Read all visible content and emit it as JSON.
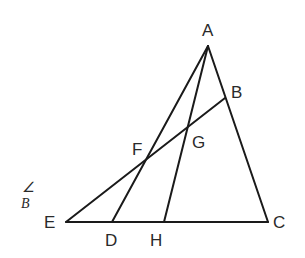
{
  "diagram": {
    "type": "geometry-figure",
    "points": [
      {
        "id": "A",
        "label": "A",
        "x": 208,
        "y": 46,
        "label_x": 202,
        "label_y": 36
      },
      {
        "id": "B",
        "label": "B",
        "x": 225,
        "y": 98,
        "label_x": 231,
        "label_y": 98
      },
      {
        "id": "C",
        "label": "C",
        "x": 268,
        "y": 222,
        "label_x": 273,
        "label_y": 228
      },
      {
        "id": "D",
        "label": "D",
        "x": 112,
        "y": 222,
        "label_x": 105,
        "label_y": 246
      },
      {
        "id": "E",
        "label": "E",
        "x": 66,
        "y": 222,
        "label_x": 44,
        "label_y": 228
      },
      {
        "id": "F",
        "label": "F",
        "x": 146,
        "y": 161,
        "label_x": 132,
        "label_y": 155
      },
      {
        "id": "G",
        "label": "G",
        "x": 189,
        "y": 127,
        "label_x": 192,
        "label_y": 148
      },
      {
        "id": "H",
        "label": "H",
        "x": 164,
        "y": 222,
        "label_x": 150,
        "label_y": 246
      }
    ],
    "segments": [
      {
        "from": "A",
        "to": "C"
      },
      {
        "from": "A",
        "to": "D"
      },
      {
        "from": "A",
        "to": "H"
      },
      {
        "from": "E",
        "to": "C"
      },
      {
        "from": "E",
        "to": "B"
      }
    ],
    "margin_note": {
      "angle_symbol": "∠",
      "letter": "B"
    },
    "stroke_color": "#1a1a1a",
    "label_color": "#2a2a2a"
  }
}
